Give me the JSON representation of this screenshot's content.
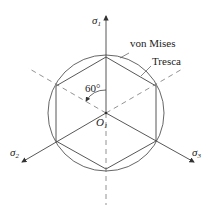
{
  "diagram": {
    "axes": [
      {
        "symbol": "σ",
        "sub": "1",
        "direction": "up"
      },
      {
        "symbol": "σ",
        "sub": "2",
        "direction": "lower-left"
      },
      {
        "symbol": "σ",
        "sub": "3",
        "direction": "lower-right"
      }
    ],
    "origin": {
      "symbol": "O",
      "sub": "1"
    },
    "angle_label": "60°",
    "curves": [
      {
        "name": "von Mises",
        "shape": "circle"
      },
      {
        "name": "Tresca",
        "shape": "hexagon"
      }
    ],
    "colors": {
      "line": "#555555",
      "dash": "#777777"
    }
  }
}
